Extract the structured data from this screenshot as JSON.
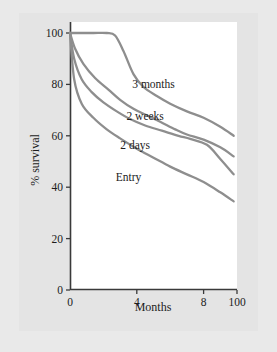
{
  "chart_data": {
    "type": "line",
    "title": "",
    "xlabel": "Months",
    "ylabel": "% survival",
    "xlim": [
      0,
      10
    ],
    "ylim": [
      0,
      100
    ],
    "grid": false,
    "legend_position": "inline-labels",
    "x_tick_labels": [
      "0",
      "4",
      "8",
      "100"
    ],
    "x_tick_values": [
      0,
      4,
      8,
      10
    ],
    "y_tick_labels": [
      "0",
      "20",
      "40",
      "60",
      "80",
      "100"
    ],
    "y_tick_values": [
      0,
      20,
      40,
      60,
      80,
      100
    ],
    "series": [
      {
        "name": "3 months",
        "label": "3 months",
        "x": [
          0,
          0.6,
          1.4,
          2.2,
          2.7,
          3.2,
          3.8,
          4.4,
          5.2,
          6.0,
          7.0,
          8.0,
          9.0,
          9.8
        ],
        "values": [
          100,
          100,
          100,
          100,
          99,
          93,
          84,
          79,
          75.5,
          72.5,
          69.5,
          67,
          63.5,
          60
        ]
      },
      {
        "name": "2 weeks",
        "label": "2 weeks",
        "x": [
          0,
          0.3,
          0.8,
          1.5,
          2.3,
          3.0,
          3.8,
          4.6,
          5.4,
          6.3,
          7.0,
          8.0,
          9.0,
          9.8
        ],
        "values": [
          100,
          94,
          88,
          82.5,
          78,
          74,
          70.5,
          68,
          65.5,
          62.5,
          60.5,
          58.5,
          55.5,
          52
        ]
      },
      {
        "name": "2 days",
        "label": "2 days",
        "x": [
          0,
          0.25,
          0.7,
          1.3,
          2.0,
          2.8,
          3.6,
          4.5,
          5.5,
          6.5,
          7.2,
          8.2,
          9.0,
          9.8
        ],
        "values": [
          100,
          90,
          82,
          77,
          73,
          69.5,
          66.5,
          64,
          62,
          60,
          58.8,
          56.5,
          51,
          45
        ]
      },
      {
        "name": "Entry",
        "label": "Entry",
        "x": [
          0,
          0.25,
          0.7,
          1.4,
          2.2,
          3.0,
          4.0,
          5.0,
          6.0,
          7.0,
          8.0,
          9.0,
          9.8
        ],
        "values": [
          100,
          82,
          72.5,
          67,
          62.5,
          59,
          55,
          51.5,
          48,
          45,
          42,
          38,
          34.5
        ]
      }
    ],
    "series_label_positions": [
      {
        "name": "3 months",
        "x": 5.0,
        "y": 78.5
      },
      {
        "name": "2 weeks",
        "x": 4.5,
        "y": 66.0
      },
      {
        "name": "2 days",
        "x": 3.9,
        "y": 55.0
      },
      {
        "name": "Entry",
        "x": 3.5,
        "y": 42.5
      }
    ],
    "colors": {
      "curve": "#8e8e8e",
      "axis": "#3a3a3a",
      "text": "#1c1c1c",
      "plot_background": "#ffffff",
      "panel_background": "#e4e4e4",
      "page_background": "#e9e9e9"
    }
  }
}
